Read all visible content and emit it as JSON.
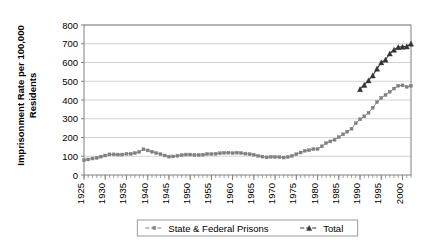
{
  "chart_data": {
    "type": "line",
    "title": "",
    "xlabel": "",
    "ylabel": "Imprisonment Rate per 100,000 Residents",
    "ylabel_line1": "Imprisonment Rate per 100,000",
    "ylabel_line2": "Residents",
    "ylim": [
      0,
      800
    ],
    "ytick_step": 100,
    "yticks": [
      "0",
      "100",
      "200",
      "300",
      "400",
      "500",
      "600",
      "700",
      "800"
    ],
    "xlim": [
      1925,
      2002
    ],
    "xtick_step": 5,
    "xticks": [
      "1925",
      "1930",
      "1935",
      "1940",
      "1945",
      "1950",
      "1955",
      "1960",
      "1965",
      "1970",
      "1975",
      "1980",
      "1985",
      "1990",
      "1995",
      "2000"
    ],
    "minor_xtick_step": 1,
    "grid": "horizontal",
    "legend_position": "bottom",
    "plot_bg": "#ffffff",
    "border_color": "#808080",
    "grid_color": "#c0c0c0",
    "series": [
      {
        "name": "State & Federal Prisons",
        "color": "#808080",
        "marker": "square",
        "x": [
          1925,
          1926,
          1927,
          1928,
          1929,
          1930,
          1931,
          1932,
          1933,
          1934,
          1935,
          1936,
          1937,
          1938,
          1939,
          1940,
          1941,
          1942,
          1943,
          1944,
          1945,
          1946,
          1947,
          1948,
          1949,
          1950,
          1951,
          1952,
          1953,
          1954,
          1955,
          1956,
          1957,
          1958,
          1959,
          1960,
          1961,
          1962,
          1963,
          1964,
          1965,
          1966,
          1967,
          1968,
          1969,
          1970,
          1971,
          1972,
          1973,
          1974,
          1975,
          1976,
          1977,
          1978,
          1979,
          1980,
          1981,
          1982,
          1983,
          1984,
          1985,
          1986,
          1987,
          1988,
          1989,
          1990,
          1991,
          1992,
          1993,
          1994,
          1995,
          1996,
          1997,
          1998,
          1999,
          2000,
          2001,
          2002
        ],
        "values": [
          79,
          83,
          88,
          91,
          98,
          104,
          110,
          110,
          109,
          109,
          113,
          113,
          117,
          123,
          137,
          131,
          124,
          117,
          111,
          104,
          98,
          99,
          103,
          106,
          109,
          109,
          107,
          107,
          108,
          112,
          112,
          113,
          116,
          118,
          119,
          117,
          119,
          117,
          114,
          111,
          108,
          102,
          98,
          94,
          97,
          96,
          95,
          93,
          96,
          102,
          111,
          120,
          129,
          132,
          138,
          139,
          153,
          170,
          179,
          188,
          202,
          217,
          231,
          247,
          276,
          297,
          313,
          332,
          359,
          389,
          411,
          427,
          444,
          461,
          476,
          478,
          470,
          476
        ]
      },
      {
        "name": "Total",
        "color": "#333333",
        "marker": "triangle",
        "x": [
          1990,
          1991,
          1992,
          1993,
          1994,
          1995,
          1996,
          1997,
          1998,
          1999,
          2000,
          2001,
          2002
        ],
        "values": [
          458,
          481,
          505,
          531,
          567,
          601,
          615,
          648,
          668,
          682,
          684,
          686,
          701
        ]
      }
    ],
    "legend": [
      {
        "label": "State & Federal Prisons",
        "color": "#808080",
        "marker": "square"
      },
      {
        "label": "Total",
        "color": "#333333",
        "marker": "triangle"
      }
    ]
  }
}
